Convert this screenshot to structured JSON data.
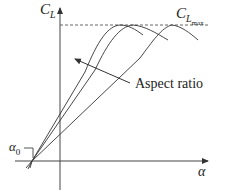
{
  "labels": {
    "y_axis_main": "C",
    "y_axis_sub": "L",
    "clmax_main": "C",
    "clmax_sub": "L",
    "clmax_subsub": "max",
    "annotation": "Aspect ratio",
    "alpha0_main": "α",
    "alpha0_sub": "0",
    "x_axis": "α"
  },
  "diagram": {
    "type": "lift curve vs angle of attack",
    "curves": 3,
    "arrow_direction": "increasing aspect ratio toward steeper slope",
    "line_color": "#333333"
  }
}
